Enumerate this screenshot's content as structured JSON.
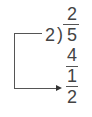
{
  "division": {
    "quotient": "2",
    "divisor": "2",
    "dividend": "5",
    "bracket": ")",
    "product": "4",
    "remainder": "1",
    "remainder_denominator": "2"
  },
  "colors": {
    "text": "#444444",
    "lines": "#555555"
  }
}
